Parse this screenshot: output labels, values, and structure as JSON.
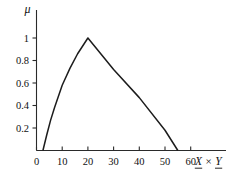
{
  "figure": {
    "name": "fuzzy-membership-plot",
    "background_color": "#ffffff",
    "line_color": "#1c1c1c",
    "axis_color": "#2a2a2a"
  },
  "labels": {
    "mu_symbol": "μ",
    "x_axis_title_first": "X",
    "x_axis_title_operator": "×",
    "x_axis_title_second": "Y"
  },
  "chart_data": {
    "type": "line",
    "title": "",
    "xlabel": "X × Y",
    "ylabel": "μ",
    "xlim": [
      0,
      68
    ],
    "ylim": [
      0,
      1.12
    ],
    "grid": false,
    "legend": null,
    "x_ticks": [
      0,
      10,
      20,
      30,
      40,
      50,
      60
    ],
    "x_tick_labels": [
      "0",
      "10",
      "20",
      "30",
      "40",
      "50",
      "60"
    ],
    "y_ticks": [
      0.2,
      0.4,
      0.6,
      0.8,
      1
    ],
    "y_tick_labels": [
      "0.2",
      "0.4",
      "0.6",
      "0.8",
      "1"
    ],
    "series": [
      {
        "name": "membership",
        "x": [
          2.5,
          4.0,
          5.5,
          7.0,
          10.0,
          13.0,
          16.0,
          20.0,
          30.0,
          40.0,
          50.0,
          55.0
        ],
        "y": [
          0.0,
          0.14,
          0.27,
          0.38,
          0.58,
          0.73,
          0.86,
          1.0,
          0.72,
          0.47,
          0.18,
          0.0
        ]
      }
    ],
    "annotations": [
      {
        "text": "peak",
        "x": 20,
        "y": 1.0
      },
      {
        "text": "left-zero",
        "x": 2.5,
        "y": 0.0
      },
      {
        "text": "right-zero",
        "x": 55,
        "y": 0.0
      }
    ]
  }
}
